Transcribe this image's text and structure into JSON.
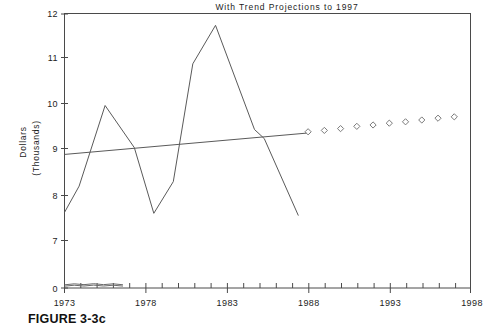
{
  "caption": "FIGURE 3-3c",
  "chart_data": {
    "type": "line",
    "title": "With Trend Projections to 1997",
    "xlabel": "",
    "ylabel": "Dollars",
    "ylabel_sub": "(Thousands)",
    "xlim": [
      1973,
      1998
    ],
    "ylim": [
      7,
      12
    ],
    "y_axis_broken_at_zero": true,
    "grid": false,
    "legend_position": "none",
    "xticks": [
      1973,
      1978,
      1983,
      1988,
      1993,
      1998
    ],
    "xtick_labels": [
      "1973",
      "1978",
      "1983",
      "1988",
      "1993",
      "1998"
    ],
    "x_minor_tick_interval": 1,
    "yticks": [
      0,
      7,
      8,
      9,
      10,
      11,
      12
    ],
    "ytick_labels": [
      "0",
      "7",
      "8",
      "9",
      "10",
      "11",
      "12"
    ],
    "series": [
      {
        "name": "Actual",
        "type": "line",
        "color": "#5a5a5a",
        "x": [
          1973.0,
          1973.9,
          1975.5,
          1977.3,
          1978.5,
          1979.7,
          1980.9,
          1982.3,
          1984.7,
          1985.3,
          1987.4
        ],
        "values": [
          7.62,
          8.2,
          9.98,
          9.05,
          7.6,
          8.3,
          10.9,
          11.75,
          9.45,
          9.25,
          7.55
        ]
      },
      {
        "name": "Trend",
        "type": "line",
        "color": "#5a5a5a",
        "x": [
          1973.0,
          1987.9
        ],
        "values": [
          8.9,
          9.37
        ]
      },
      {
        "name": "Projection",
        "type": "scatter",
        "marker": "diamond",
        "color": "#7a7a7a",
        "x": [
          1988,
          1989,
          1990,
          1991,
          1992,
          1993,
          1994,
          1995,
          1996,
          1997
        ],
        "values": [
          9.4,
          9.43,
          9.47,
          9.52,
          9.55,
          9.59,
          9.62,
          9.66,
          9.7,
          9.73
        ]
      },
      {
        "name": "Baseline sketch upper",
        "type": "line",
        "color": "#6a6a6a",
        "x": [
          1973.0,
          1973.6,
          1974.2,
          1974.8,
          1975.4,
          1976.0,
          1976.6
        ],
        "values": [
          0.55,
          0.72,
          0.58,
          0.74,
          0.58,
          0.72,
          0.56
        ]
      },
      {
        "name": "Baseline sketch lower",
        "type": "line",
        "color": "#6a6a6a",
        "x": [
          1973.0,
          1973.6,
          1974.2,
          1974.8,
          1975.4,
          1976.0,
          1976.6
        ],
        "values": [
          0.32,
          0.48,
          0.34,
          0.5,
          0.34,
          0.48,
          0.33
        ]
      }
    ]
  }
}
